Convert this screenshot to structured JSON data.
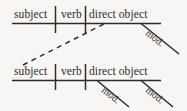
{
  "figure": {
    "ink_color": "#2e2c2b",
    "background_color": "#f7f6f4",
    "clauses": [
      {
        "name": "upper-clause",
        "slots": [
          {
            "role": "subject",
            "label": "subject"
          },
          {
            "role": "verb",
            "label": "verb"
          },
          {
            "role": "direct-object",
            "label": "direct object"
          }
        ],
        "modifiers": [
          {
            "label": "mod.",
            "attached_to": "direct object"
          }
        ]
      },
      {
        "name": "lower-clause",
        "slots": [
          {
            "role": "subject",
            "label": "subject"
          },
          {
            "role": "verb",
            "label": "verb"
          },
          {
            "role": "direct-object",
            "label": "direct object"
          }
        ],
        "modifiers": [
          {
            "label": "mod.",
            "attached_to": "direct object"
          },
          {
            "label": "mod.",
            "attached_to": "direct object"
          }
        ]
      }
    ],
    "connector": {
      "style": "dashed",
      "from": "lower-clause subject",
      "to": "upper-clause direct object"
    }
  }
}
